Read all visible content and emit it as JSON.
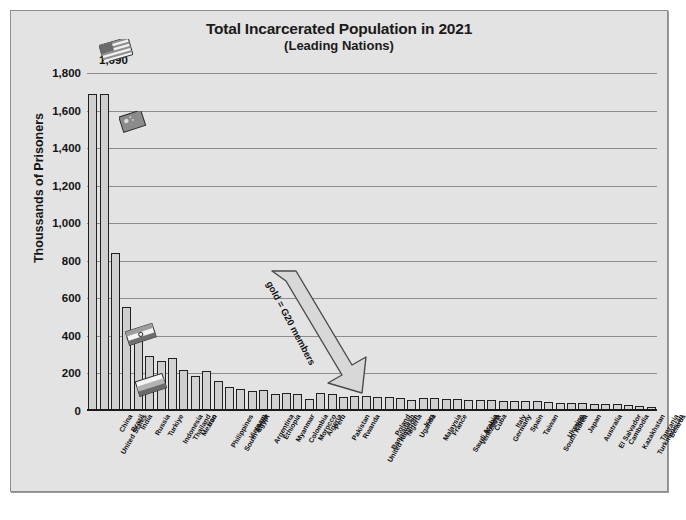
{
  "chart": {
    "title": "Total Incarcerated Population in 2021",
    "subtitle": "(Leading Nations)",
    "ylabel": "Thoussands of Prisoners",
    "peak_label": "1,690",
    "annotation": "gold = G20 members",
    "footer": ""
  },
  "colors": {
    "figure_background": "#e3e3e3",
    "bar_fill": "#d2d2d2",
    "bar_outline": "#202020",
    "gridline": "#8c8c8c",
    "text": "#111111"
  },
  "chart_data": {
    "type": "bar",
    "title": "Total Incarcerated Population in 2021 (Leading Nations)",
    "xlabel": "",
    "ylabel": "Thoussands of Prisoners",
    "ylim": [
      0,
      1800
    ],
    "yticks": [
      "0",
      "200",
      "400",
      "600",
      "800",
      "1,000",
      "1,200",
      "1,400",
      "1,600",
      "1,800"
    ],
    "ytick_values": [
      0,
      200,
      400,
      600,
      800,
      1000,
      1200,
      1400,
      1600,
      1800
    ],
    "grid": true,
    "legend": "none",
    "annotations": [
      "gold = G20 members",
      "1,690"
    ],
    "units": "thousands of prisoners",
    "categories": [
      "United States",
      "China",
      "Brazil",
      "India",
      "Russia",
      "Turkiye",
      "Indonesia",
      "Thailand",
      "Mexico",
      "Iran",
      "Philippines",
      "South Africa",
      "Vietnam",
      "Egypt",
      "Argentina",
      "Ethiopia",
      "Myanmar",
      "Colombia",
      "Morocco",
      "Algeria",
      "Peru",
      "Pakistan",
      "Rwanda",
      "United Kingdom",
      "Bangladesh",
      "Poland",
      "Nigeria",
      "Uganda",
      "Iraq",
      "Malaysia",
      "France",
      "Saudi Arabia",
      "Venezuela",
      "Kenya",
      "Cuba",
      "Germany",
      "Italy",
      "Spain",
      "Taiwan",
      "South Korea",
      "Ukraine",
      "Chile",
      "Japan",
      "Australia",
      "El Salvador",
      "Cambodia",
      "Kazakhstan",
      "Turkmenistan",
      "Tanzania",
      "Belarus"
    ],
    "values": [
      1690,
      1690,
      840,
      554,
      433,
      291,
      266,
      280,
      220,
      189,
      215,
      158,
      130,
      119,
      104,
      113,
      92,
      97,
      89,
      62,
      95,
      88,
      76,
      79,
      82,
      72,
      74,
      68,
      60,
      71,
      70,
      66,
      64,
      60,
      57,
      59,
      54,
      55,
      55,
      53,
      50,
      44,
      42,
      43,
      37,
      39,
      35,
      30,
      29,
      24
    ],
    "g20_members": [
      "United States",
      "China",
      "Brazil",
      "India",
      "Russia",
      "Turkiye",
      "Indonesia",
      "Mexico",
      "South Africa",
      "Argentina",
      "United Kingdom",
      "France",
      "Saudi Arabia",
      "Germany",
      "Italy",
      "South Korea",
      "Japan",
      "Australia",
      "Canada"
    ]
  },
  "icons": {
    "flag_us": "us-flag-icon",
    "flag_cn": "china-flag-icon",
    "flag_in": "india-flag-icon",
    "flag_ru": "russia-flag-icon"
  }
}
